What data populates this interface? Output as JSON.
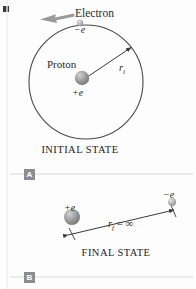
{
  "figure": {
    "background": "#fdfdfd"
  },
  "colors": {
    "stroke": "#3a3a3a",
    "sphere_proton": "#9a9a9a",
    "sphere_electron": "#b9b9b9",
    "rule": "#d8d8d8",
    "marker_bg": "#8d8d8d",
    "marker_text": "#ffffff",
    "text": "#2b2b2b",
    "arrow_gray": "#8a8a8a"
  },
  "initial_state": {
    "electron_label": "Electron",
    "electron_charge": "−e",
    "proton_label": "Proton",
    "proton_charge": "+e",
    "radius_symbol": "r",
    "radius_subscript": "i",
    "caption": "INITIAL STATE",
    "orbit": {
      "cx": 86,
      "cy": 82,
      "r": 57
    },
    "proton_sphere": {
      "cx": 82,
      "cy": 78,
      "r": 7
    },
    "electron_sphere": {
      "cx": 80,
      "cy": 23,
      "r": 3
    },
    "radius_arrow": {
      "x1": 84,
      "y1": 79,
      "x2": 132,
      "y2": 47
    },
    "motion_arrow": {
      "x1": 72,
      "y1": 15,
      "x2": 40,
      "y2": 20
    }
  },
  "final_state": {
    "proton_charge": "+e",
    "electron_charge": "−e",
    "distance_symbol": "r",
    "distance_subscript": "f",
    "distance_equals": "=",
    "distance_value": "∞",
    "caption": "FINAL STATE",
    "proton_sphere": {
      "cx": 72,
      "cy": 217,
      "r": 8
    },
    "electron_sphere": {
      "cx": 172,
      "cy": 202,
      "r": 4
    },
    "arrow": {
      "x1": 66,
      "y1": 236,
      "x2": 172,
      "y2": 211
    }
  },
  "markers": {
    "panel_a": "A",
    "panel_b": "B"
  },
  "rules": {
    "rule_a_y": 174,
    "rule_b_y": 277
  }
}
